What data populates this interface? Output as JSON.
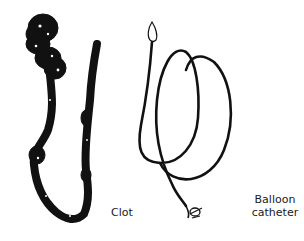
{
  "figure": {
    "items": [
      {
        "name": "clot",
        "label": "Clot"
      },
      {
        "name": "balloon-catheter",
        "label_line1": "Balloon",
        "label_line2": "catheter"
      }
    ],
    "colors": {
      "background": "#ffffff",
      "ink": "#111111"
    }
  }
}
